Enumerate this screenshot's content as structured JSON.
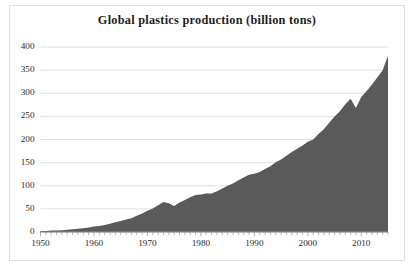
{
  "chart_data": {
    "type": "area",
    "title": "Global plastics production (billion tons)",
    "xlabel": "",
    "ylabel": "",
    "xlim": [
      1950,
      2015
    ],
    "ylim": [
      0,
      400
    ],
    "grid": true,
    "legend": "none",
    "series_color": "#5a5a5a",
    "gridline_color": "#d8d8d8",
    "ytick_labels": [
      "0",
      "50",
      "100",
      "150",
      "200",
      "250",
      "300",
      "350",
      "400"
    ],
    "ytick_values": [
      0,
      50,
      100,
      150,
      200,
      250,
      300,
      350,
      400
    ],
    "xtick_labels": [
      "1950",
      "1960",
      "1970",
      "1980",
      "1990",
      "2000",
      "2010"
    ],
    "xtick_values": [
      1950,
      1960,
      1970,
      1980,
      1990,
      2000,
      2010
    ],
    "minor_xticks_interval": 1,
    "x": [
      1950,
      1951,
      1952,
      1953,
      1954,
      1955,
      1956,
      1957,
      1958,
      1959,
      1960,
      1961,
      1962,
      1963,
      1964,
      1965,
      1966,
      1967,
      1968,
      1969,
      1970,
      1971,
      1972,
      1973,
      1974,
      1975,
      1976,
      1977,
      1978,
      1979,
      1980,
      1981,
      1982,
      1983,
      1984,
      1985,
      1986,
      1987,
      1988,
      1989,
      1990,
      1991,
      1992,
      1993,
      1994,
      1995,
      1996,
      1997,
      1998,
      1999,
      2000,
      2001,
      2002,
      2003,
      2004,
      2005,
      2006,
      2007,
      2008,
      2009,
      2010,
      2011,
      2012,
      2013,
      2014,
      2015
    ],
    "values": [
      2,
      2,
      3,
      3,
      4,
      5,
      6,
      7,
      8,
      10,
      12,
      13,
      15,
      18,
      21,
      24,
      27,
      30,
      35,
      40,
      46,
      51,
      58,
      65,
      62,
      56,
      64,
      69,
      75,
      80,
      81,
      83,
      83,
      88,
      94,
      100,
      105,
      112,
      118,
      124,
      126,
      130,
      136,
      142,
      151,
      157,
      165,
      173,
      180,
      187,
      195,
      200,
      212,
      222,
      236,
      250,
      261,
      276,
      288,
      268,
      292,
      305,
      319,
      334,
      350,
      381
    ]
  }
}
